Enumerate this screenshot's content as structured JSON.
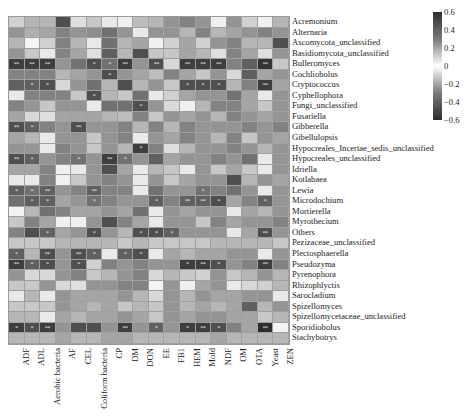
{
  "chart_data": {
    "type": "heatmap",
    "title": "",
    "xlabel": "",
    "ylabel": "",
    "colorbar": {
      "min": -0.6,
      "max": 0.6,
      "ticks": [
        "0.6",
        "0.4",
        "0.2",
        "0",
        "−0.2",
        "−0.4",
        "−0.6"
      ],
      "colormap": "grayscale diverging (white at 0, dark at ±0.6)"
    },
    "columns": [
      "ADF",
      "ADL",
      "Aerobic bacteria",
      "AF",
      "CEL",
      "Coliform bacteria",
      "CP",
      "DM",
      "DON",
      "EE",
      "FB1",
      "HEM",
      "Mold",
      "NDF",
      "OM",
      "OTA",
      "Yeast",
      "ZEN"
    ],
    "rows": [
      "Acremonium",
      "Alternaria",
      "Ascomycota_unclassified",
      "Basidiomycota_unclassified",
      "Bulleromyces",
      "Cochliobolus",
      "Cryptococcus",
      "Cyphellophora",
      "Fungi_unclassified",
      "Fusariella",
      "Gibberella",
      "Gibellulopsis",
      "Hypocreales_Incertae_sedis_unclassified",
      "Hypocreales_unclassified",
      "Idriella",
      "Kotlabaea",
      "Lewia",
      "Microdochium",
      "Mortierella",
      "Myrothecium",
      "Others",
      "Pezizaceae_unclassified",
      "Plectosphaerella",
      "Pseudozyma",
      "Pyrenophora",
      "Rhizophlyctis",
      "Sarocladium",
      "Spizellomyces",
      "Spizellomycetaceae_unclassified",
      "Sporidiobolus",
      "Stachybotrys"
    ],
    "values": [
      [
        0.12,
        0.2,
        0.2,
        0.5,
        0.08,
        0.15,
        0.05,
        0.03,
        0.18,
        0.2,
        0.3,
        0.35,
        0.3,
        0.03,
        0.3,
        0.12,
        0.03,
        0.2
      ],
      [
        0.3,
        0.22,
        0.25,
        0.35,
        0.3,
        0.32,
        0.4,
        0.3,
        0.05,
        0.3,
        0.3,
        0.2,
        0.35,
        0.2,
        0.25,
        0.3,
        0.35,
        0.3
      ],
      [
        0.2,
        0.02,
        0.12,
        0.35,
        0.2,
        0.05,
        0.4,
        0.2,
        0.25,
        0.03,
        0.12,
        0.25,
        0.12,
        0.3,
        0.35,
        0.2,
        0.2,
        0.5
      ],
      [
        0.3,
        0.15,
        0.05,
        0.35,
        0.25,
        0.08,
        0.45,
        0.2,
        0.5,
        0.15,
        0.15,
        0.25,
        0.2,
        0.08,
        0.35,
        0.25,
        0.08,
        0.3
      ],
      [
        -0.55,
        -0.55,
        -0.55,
        0.3,
        -0.4,
        -0.5,
        -0.4,
        -0.55,
        0.3,
        -0.5,
        0.1,
        -0.55,
        -0.55,
        -0.55,
        0.35,
        -0.45,
        -0.58,
        0.15
      ],
      [
        0.35,
        0.35,
        0.35,
        0.2,
        0.25,
        0.3,
        -0.5,
        0.3,
        0.25,
        0.18,
        0.35,
        0.25,
        0.15,
        0.3,
        0.1,
        0.45,
        0.25,
        0.3
      ],
      [
        -0.45,
        -0.45,
        -0.5,
        0.1,
        0.3,
        0.4,
        0.2,
        -0.5,
        0.2,
        0.3,
        0.15,
        -0.5,
        -0.5,
        -0.5,
        0.2,
        0.35,
        -0.55,
        0.25
      ],
      [
        0.05,
        0.35,
        0.35,
        0.35,
        0.15,
        -0.5,
        0.2,
        0.15,
        0.4,
        0.05,
        0.12,
        0.25,
        0.3,
        0.3,
        0.4,
        0.25,
        0.05,
        0.3
      ],
      [
        0.35,
        0.3,
        0.15,
        0.3,
        0.3,
        0.05,
        0.4,
        0.4,
        -0.5,
        0.3,
        0.1,
        0.03,
        0.2,
        0.35,
        0.35,
        0.25,
        0.15,
        0.3
      ],
      [
        0.25,
        0.1,
        0.08,
        0.25,
        0.25,
        0.25,
        0.2,
        0.18,
        0.35,
        0.15,
        0.3,
        0.25,
        0.3,
        0.2,
        0.35,
        0.3,
        0.25,
        0.3
      ],
      [
        -0.5,
        -0.45,
        0.35,
        0.3,
        -0.5,
        0.3,
        0.3,
        0.35,
        0.2,
        0.35,
        0.2,
        0.35,
        0.3,
        0.3,
        0.3,
        0.35,
        0.3,
        0.35
      ],
      [
        0.25,
        0.2,
        0.05,
        0.3,
        0.3,
        0.15,
        0.3,
        0.35,
        0.05,
        0.3,
        0.25,
        0.35,
        0.3,
        0.2,
        0.35,
        0.15,
        0.3,
        0.25
      ],
      [
        0.3,
        0.3,
        0.05,
        0.35,
        0.3,
        0.15,
        0.3,
        0.2,
        -0.55,
        0.35,
        0.08,
        0.2,
        0.3,
        0.3,
        0.35,
        0.3,
        0.2,
        0.3
      ],
      [
        -0.5,
        -0.45,
        0.3,
        0.35,
        -0.4,
        0.3,
        -0.55,
        -0.4,
        0.3,
        0.45,
        0.25,
        0.3,
        0.3,
        0.35,
        0.3,
        0.4,
        0.05,
        0.3
      ],
      [
        0.25,
        0.25,
        0.35,
        0.03,
        0.05,
        0.3,
        0.5,
        0.25,
        0.05,
        0.2,
        0.15,
        0.05,
        0.3,
        0.15,
        0.25,
        0.15,
        0.05,
        0.3
      ],
      [
        0.05,
        0.05,
        0.35,
        0.03,
        0.15,
        0.3,
        0.35,
        0.3,
        0.05,
        0.3,
        0.15,
        0.25,
        0.3,
        0.3,
        0.5,
        0.2,
        0.3,
        0.25
      ],
      [
        -0.45,
        -0.4,
        -0.45,
        0.3,
        0.35,
        -0.45,
        0.35,
        0.35,
        0.05,
        0.4,
        0.3,
        0.3,
        -0.4,
        0.35,
        0.4,
        0.3,
        0.05,
        0.3
      ],
      [
        0.4,
        -0.45,
        -0.45,
        0.25,
        0.3,
        -0.4,
        0.35,
        0.3,
        0.3,
        -0.45,
        0.35,
        -0.45,
        -0.45,
        -0.5,
        0.25,
        0.35,
        -0.45,
        0.3
      ],
      [
        0.02,
        0.2,
        0.4,
        0.35,
        0.25,
        0.25,
        0.3,
        0.25,
        0.4,
        0.05,
        0.3,
        0.25,
        0.3,
        0.3,
        0.05,
        0.25,
        0.2,
        0.3
      ],
      [
        0.15,
        0.35,
        0.25,
        0.03,
        0.03,
        0.3,
        -0.5,
        0.35,
        0.25,
        0.05,
        0.3,
        0.3,
        0.15,
        0.35,
        0.25,
        0.3,
        0.3,
        0.35
      ],
      [
        0.35,
        0.5,
        -0.45,
        0.25,
        0.3,
        -0.5,
        0.3,
        0.2,
        -0.5,
        -0.5,
        -0.45,
        0.3,
        0.3,
        0.3,
        0.05,
        0.25,
        -0.5,
        0.3
      ],
      [
        0.15,
        0.15,
        0.15,
        0.2,
        0.2,
        0.2,
        0.2,
        0.15,
        0.2,
        0.15,
        0.15,
        0.15,
        0.15,
        0.2,
        0.2,
        0.2,
        0.2,
        0.15
      ],
      [
        -0.45,
        0.2,
        -0.5,
        0.3,
        -0.5,
        -0.45,
        0.05,
        -0.45,
        -0.5,
        0.05,
        0.25,
        0.2,
        0.25,
        0.25,
        0.3,
        0.3,
        0.05,
        0.3
      ],
      [
        -0.55,
        -0.45,
        -0.5,
        0.3,
        -0.5,
        0.12,
        0.35,
        0.3,
        0.35,
        0.3,
        0.3,
        -0.55,
        -0.55,
        -0.5,
        0.3,
        0.35,
        -0.55,
        0.35
      ],
      [
        0.3,
        0.1,
        0.1,
        0.3,
        0.35,
        0.15,
        0.2,
        0.3,
        0.35,
        0.1,
        0.2,
        0.15,
        0.12,
        0.3,
        0.15,
        0.2,
        0.3,
        0.2
      ],
      [
        0.15,
        0.15,
        0.3,
        0.1,
        0.08,
        0.3,
        0.3,
        0.35,
        0.35,
        0.02,
        0.3,
        0.03,
        0.25,
        0.3,
        0.05,
        0.1,
        0.12,
        0.2
      ],
      [
        0.05,
        0.2,
        0.05,
        0.3,
        0.25,
        0.25,
        0.25,
        0.3,
        0.2,
        0.1,
        0.3,
        0.2,
        0.3,
        0.25,
        0.25,
        0.3,
        0.3,
        0.05
      ],
      [
        0.15,
        0.15,
        0.15,
        0.3,
        0.25,
        0.2,
        0.25,
        0.15,
        0.2,
        0.15,
        0.3,
        0.2,
        0.25,
        0.2,
        0.25,
        0.45,
        0.2,
        0.3
      ],
      [
        0.2,
        0.2,
        0.05,
        0.25,
        0.2,
        0.25,
        0.25,
        0.3,
        0.25,
        0.15,
        0.3,
        0.25,
        0.3,
        0.3,
        0.25,
        0.25,
        0.15,
        0.2
      ],
      [
        -0.55,
        -0.5,
        -0.55,
        0.3,
        -0.5,
        -0.5,
        0.3,
        -0.55,
        0.3,
        -0.45,
        0.3,
        -0.55,
        -0.55,
        -0.5,
        0.35,
        0.25,
        -0.6,
        0.02
      ],
      [
        0.2,
        0.2,
        0.2,
        0.25,
        0.2,
        0.2,
        0.25,
        0.25,
        0.2,
        0.2,
        0.2,
        0.2,
        0.2,
        0.25,
        0.2,
        0.2,
        0.2,
        0.2
      ]
    ],
    "significance": {
      "Bulleromyces": {
        "ADF": "**",
        "ADL": "**",
        "Aerobic bacteria": "**",
        "Coliform bacteria": "*",
        "CP": "*",
        "DM": "**",
        "EE": "**",
        "HEM": "**",
        "Mold": "**",
        "NDF": "**",
        "Yeast": "**"
      },
      "Cochliobolus": {
        "CP": "*"
      },
      "Cryptococcus": {
        "ADL": "*",
        "Aerobic bacteria": "*",
        "HEM": "*",
        "Mold": "*",
        "NDF": "*",
        "Yeast": "**"
      },
      "Cyphellophora": {
        "Coliform bacteria": "*"
      },
      "Fungi_unclassified": {
        "DON": "*"
      },
      "Gibberella": {
        "ADF": "**",
        "ADL": "*",
        "CEL": "**"
      },
      "Hypocreales_Incertae_sedis_unclassified": {
        "DON": "*"
      },
      "Hypocreales_unclassified": {
        "ADF": "**",
        "ADL": "*",
        "CEL": "*",
        "CP": "**",
        "DM": "*"
      },
      "Lewia": {
        "ADF": "*",
        "ADL": "*",
        "Aerobic bacteria": "**",
        "Coliform bacteria": "**",
        "Mold": "*"
      },
      "Microdochium": {
        "ADL": "*",
        "Aerobic bacteria": "*",
        "Coliform bacteria": "*",
        "EE": "*",
        "HEM": "**",
        "Mold": "**",
        "NDF": "*",
        "Yeast": "*"
      },
      "Others": {
        "Aerobic bacteria": "*",
        "Coliform bacteria": "*",
        "DON": "*",
        "EE": "*",
        "FB1": "*",
        "Yeast": "**"
      },
      "Plectosphaerella": {
        "ADF": "*",
        "Aerobic bacteria": "**",
        "CEL": "**",
        "Coliform bacteria": "*",
        "DM": "*",
        "DON": "*"
      },
      "Pseudozyma": {
        "ADF": "**",
        "ADL": "*",
        "Aerobic bacteria": "*",
        "CEL": "*",
        "HEM": "*",
        "Mold": "**",
        "NDF": "*",
        "Yeast": "**"
      },
      "Sporidiobolus": {
        "ADF": "*",
        "ADL": "*",
        "Aerobic bacteria": "**",
        "DM": "**",
        "EE": "*",
        "HEM": "*",
        "Mold": "**",
        "NDF": "*",
        "Yeast": "**"
      }
    }
  },
  "colorbar_labels": [
    "0.6",
    "0.4",
    "0.2",
    "0",
    "−0.2",
    "−0.4",
    "−0.6"
  ]
}
